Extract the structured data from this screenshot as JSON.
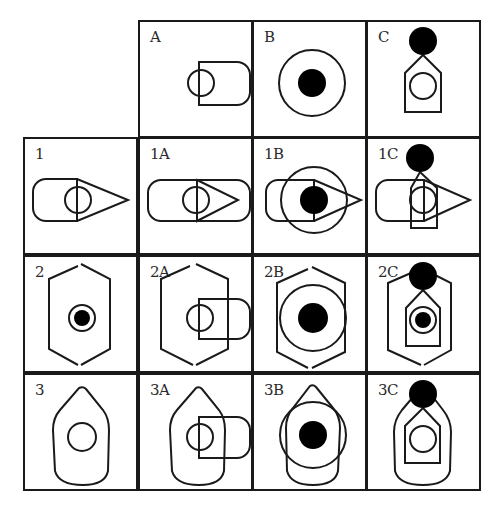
{
  "figure": {
    "type": "matrix-puzzle",
    "columns": [
      "A",
      "B",
      "C"
    ],
    "rows": [
      "1",
      "2",
      "3"
    ],
    "stroke_color": "#1a1a1a",
    "fill_color": "#000000",
    "background": "#ffffff"
  },
  "cells": {
    "A": {
      "label": "A",
      "components": [
        "circle-with-rounded-tab"
      ]
    },
    "B": {
      "label": "B",
      "components": [
        "ring-with-filled-dot"
      ]
    },
    "C": {
      "label": "C",
      "components": [
        "pentagon-with-circle",
        "filled-dot-on-apex"
      ]
    },
    "1": {
      "label": "1",
      "components": [
        "rounded-rect-left",
        "triangle-pointer",
        "circle"
      ]
    },
    "1A": {
      "label": "1A",
      "components": [
        "rounded-rect-left",
        "triangle-pointer",
        "circle-with-rounded-tab"
      ]
    },
    "1B": {
      "label": "1B",
      "components": [
        "rounded-rect-left",
        "triangle-pointer",
        "ring-with-filled-dot"
      ]
    },
    "1C": {
      "label": "1C",
      "components": [
        "rounded-rect-left",
        "triangle-pointer",
        "pentagon-with-circle",
        "filled-dot-on-apex"
      ]
    },
    "2": {
      "label": "2",
      "components": [
        "hexagon",
        "small-ring-with-filled-dot"
      ]
    },
    "2A": {
      "label": "2A",
      "components": [
        "hexagon",
        "circle-with-rounded-tab"
      ]
    },
    "2B": {
      "label": "2B",
      "components": [
        "hexagon",
        "ring-with-filled-dot"
      ]
    },
    "2C": {
      "label": "2C",
      "components": [
        "hexagon",
        "pentagon-with-small-ring-and-dot",
        "filled-dot-on-apex"
      ]
    },
    "3": {
      "label": "3",
      "components": [
        "boat-outline",
        "circle"
      ]
    },
    "3A": {
      "label": "3A",
      "components": [
        "boat-outline",
        "circle-with-rounded-tab"
      ]
    },
    "3B": {
      "label": "3B",
      "components": [
        "boat-outline",
        "ring-with-filled-dot"
      ]
    },
    "3C": {
      "label": "3C",
      "components": [
        "boat-outline",
        "pentagon-with-circle",
        "filled-dot-on-apex"
      ]
    }
  }
}
